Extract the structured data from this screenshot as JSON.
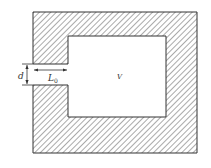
{
  "diagram": {
    "labels": {
      "neck_width": "d",
      "neck_length": "L",
      "neck_length_sub": "0",
      "volume": "V"
    },
    "colors": {
      "line": "#333333",
      "hatch": "#555555",
      "background": "#ffffff"
    }
  }
}
